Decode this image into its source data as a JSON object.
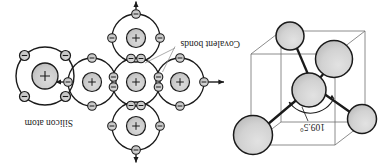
{
  "figure": {
    "title_visible": false,
    "orientation": "rotated-180",
    "background_color": "#ffffff",
    "ink_color": "#1a1a1a",
    "sphere_fill": "#cfcfcf",
    "nucleus_fill": "#c9c9c9",
    "electron_fill": "#c2c2c2",
    "thin_line_color": "#808080"
  },
  "panels": {
    "left": {
      "name": "tetrahedral-crystal-cell",
      "angle_label": "109.5°",
      "atom_count": 5,
      "bond_count": 4,
      "cube_visible": true
    },
    "center": {
      "name": "covalent-bond-lattice",
      "bonds_label": "Covalent bonds",
      "atom_count": 5,
      "shared_pair_count": 4,
      "free_bond_arrows": 4,
      "arrow_directions": [
        "up",
        "down",
        "left",
        "right"
      ]
    },
    "right": {
      "name": "single-silicon-atom",
      "atom_label": "Silicon atom",
      "nucleus_symbol": "+",
      "valence_electrons": 4,
      "electron_symbol": "−"
    }
  }
}
